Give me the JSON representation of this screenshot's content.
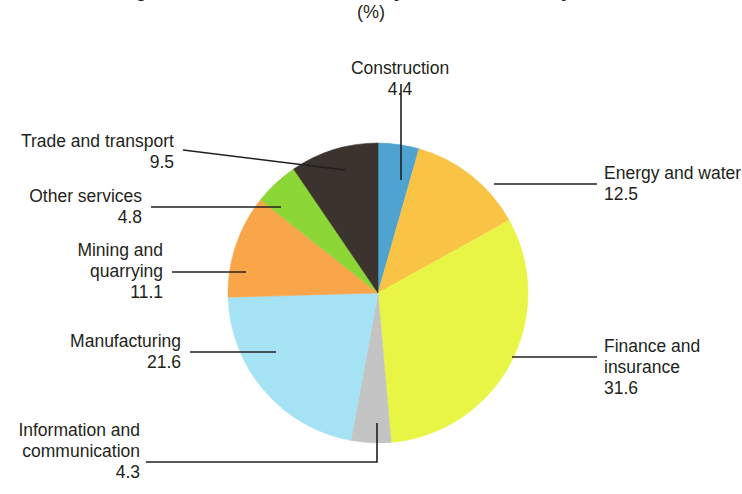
{
  "chart_data": {
    "type": "pie",
    "title": "Figure 2. Gross value added by economic activity, 2016",
    "subtitle": "(%)",
    "unit": "%",
    "xlabel": "",
    "ylabel": "",
    "legend_position": "callout-labels",
    "grid": false,
    "total": 99.8,
    "categories": [
      "Construction",
      "Energy and water",
      "Finance and insurance",
      "Information and communication",
      "Manufacturing",
      "Mining and quarrying",
      "Other services",
      "Trade and transport"
    ],
    "values": [
      4.4,
      12.5,
      31.6,
      4.3,
      21.6,
      11.1,
      4.8,
      9.5
    ],
    "colors": [
      "#4FA3D1",
      "#F9C346",
      "#E9F545",
      "#C4C4C4",
      "#A5E2F3",
      "#F9A64B",
      "#8CD636",
      "#3B332E"
    ],
    "slices": [
      {
        "label": "Construction",
        "value": 4.4,
        "value_text": "4.4",
        "color": "#4FA3D1"
      },
      {
        "label": "Energy and water",
        "value": 12.5,
        "value_text": "12.5",
        "color": "#F9C346"
      },
      {
        "label": "Finance and insurance",
        "value": 31.6,
        "value_text": "31.6",
        "color": "#E9F545"
      },
      {
        "label": "Information and communication",
        "value": 4.3,
        "value_text": "4.3",
        "color": "#C4C4C4"
      },
      {
        "label": "Manufacturing",
        "value": 21.6,
        "value_text": "21.6",
        "color": "#A5E2F3"
      },
      {
        "label": "Mining and quarrying",
        "value": 11.1,
        "value_text": "11.1",
        "color": "#F9A64B"
      },
      {
        "label": "Other services",
        "value": 4.8,
        "value_text": "4.8",
        "color": "#8CD636"
      },
      {
        "label": "Trade and transport",
        "value": 9.5,
        "value_text": "9.5",
        "color": "#3B332E"
      }
    ]
  },
  "labels": {
    "construction": {
      "line1": "Construction",
      "line2": "4.4"
    },
    "energy": {
      "line1": "Energy and water",
      "line2": "12.5"
    },
    "finance": {
      "line1": "Finance and",
      "line2": "insurance",
      "line3": "31.6"
    },
    "information": {
      "line1": "Information and",
      "line2": "communication",
      "line3": "4.3"
    },
    "manufacturing": {
      "line1": "Manufacturing",
      "line2": "21.6"
    },
    "mining": {
      "line1": "Mining and",
      "line2": "quarrying",
      "line3": "11.1"
    },
    "other_services": {
      "line1": "Other services",
      "line2": "4.8"
    },
    "trade": {
      "line1": "Trade and transport",
      "line2": "9.5"
    }
  }
}
